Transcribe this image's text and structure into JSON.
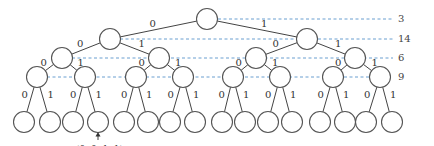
{
  "diagram": {
    "type": "binary-tree",
    "depth": 4,
    "edge_labels": {
      "left": "0",
      "right": "1"
    },
    "level_counts": [
      "3",
      "14",
      "6",
      "9"
    ],
    "highlighted_leaf_label": "(0, 0, 1, 1)",
    "colors": {
      "guide_line": "#6a9fd0",
      "node_stroke": "#555555",
      "edge": "#444444"
    }
  }
}
